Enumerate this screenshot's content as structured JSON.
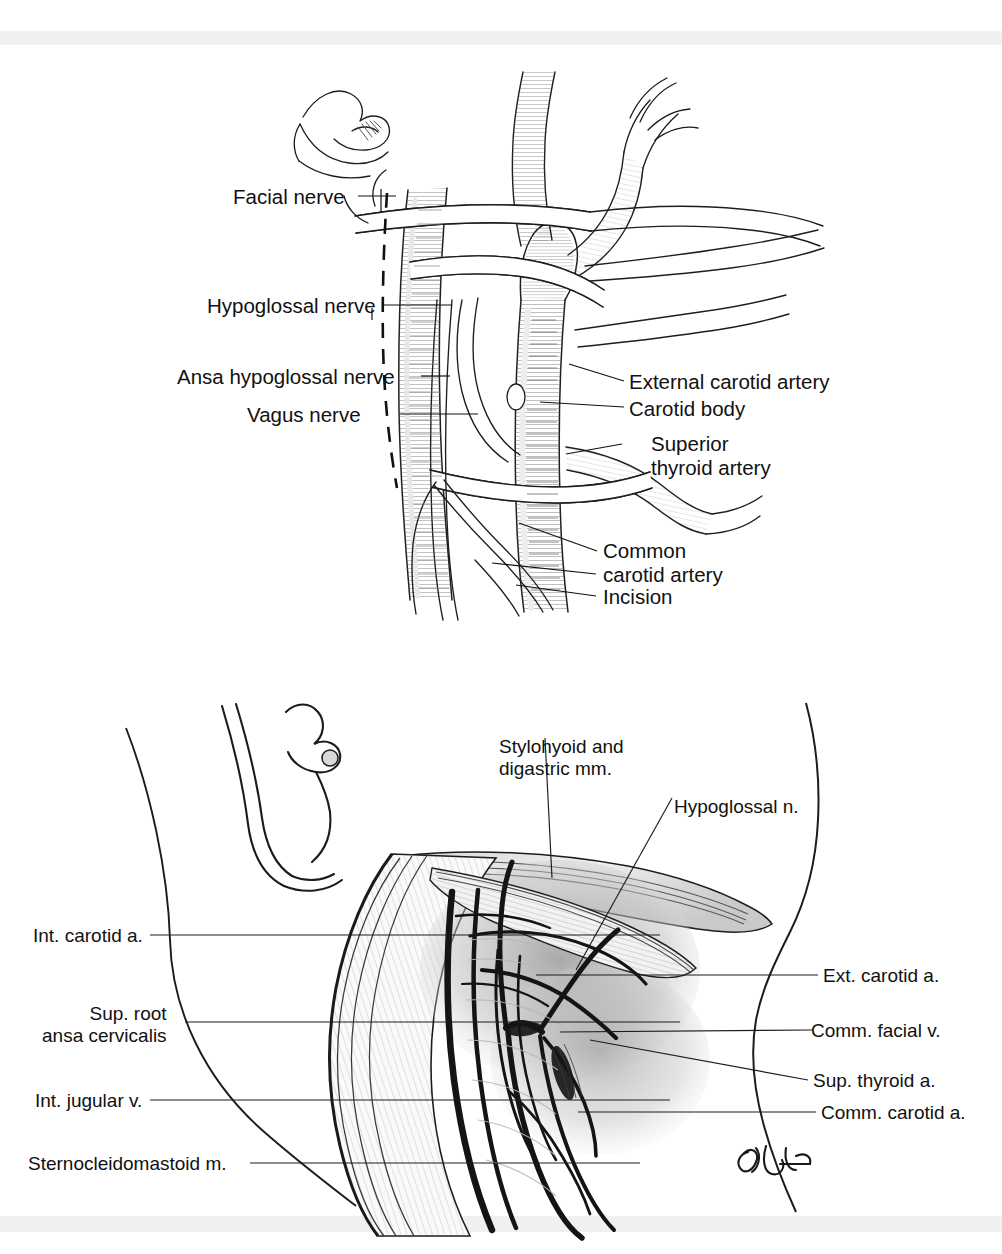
{
  "document": {
    "type": "anatomical-illustration-plate",
    "panels": 2,
    "artist_signature": "RBH"
  },
  "figure_top": {
    "name": "carotid-bifurcation-exposure",
    "labels_left": [
      {
        "id": "facial-nerve",
        "text": "Facial nerve"
      },
      {
        "id": "hypoglossal-nerve",
        "text": "Hypoglossal nerve"
      },
      {
        "id": "ansa-hypoglossal-nerve",
        "text": "Ansa hypoglossal nerve"
      },
      {
        "id": "vagus-nerve",
        "text": "Vagus nerve"
      }
    ],
    "labels_right": [
      {
        "id": "external-carotid-artery",
        "line1": "External carotid artery",
        "line2": ""
      },
      {
        "id": "carotid-body",
        "line1": "Carotid body",
        "line2": ""
      },
      {
        "id": "superior-thyroid-artery",
        "line1": "Superior",
        "line2": "thyroid artery"
      },
      {
        "id": "common-carotid-artery",
        "line1": "Common",
        "line2": "carotid artery"
      },
      {
        "id": "incision",
        "line1": "Incision",
        "line2": ""
      }
    ]
  },
  "figure_bottom": {
    "name": "neck-dissection-ansa-cervicalis",
    "labels_top": [
      {
        "id": "stylohyoid-digastric",
        "line1": "Stylohyoid and",
        "line2": "digastric mm."
      },
      {
        "id": "hypoglossal-n",
        "line1": "Hypoglossal n.",
        "line2": ""
      }
    ],
    "labels_left": [
      {
        "id": "int-carotid-a",
        "line1": "Int. carotid a.",
        "line2": ""
      },
      {
        "id": "sup-root-ansa",
        "line1": "Sup. root",
        "line2": "ansa cervicalis"
      },
      {
        "id": "int-jugular-v",
        "line1": "Int. jugular v.",
        "line2": ""
      },
      {
        "id": "sternocleidomastoid-m",
        "line1": "Sternocleidomastoid m.",
        "line2": ""
      }
    ],
    "labels_right": [
      {
        "id": "ext-carotid-a",
        "text": "Ext. carotid a."
      },
      {
        "id": "comm-facial-v",
        "text": "Comm. facial v."
      },
      {
        "id": "sup-thyroid-a",
        "text": "Sup. thyroid a."
      },
      {
        "id": "comm-carotid-a",
        "text": "Comm. carotid a."
      }
    ],
    "signature": "RBH"
  },
  "colors": {
    "ink": "#111111",
    "line": "#222222",
    "shade_light": "#c8c8c8",
    "shade_mid": "#8a8a8a",
    "shade_dark": "#3a3a3a",
    "scan_bar": "#f0f0f0",
    "background": "#ffffff"
  }
}
